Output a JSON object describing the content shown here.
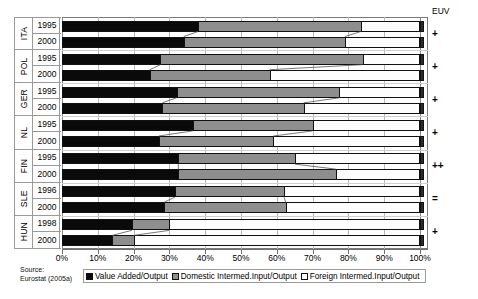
{
  "chart_data": {
    "type": "bar",
    "orientation": "horizontal",
    "stacked": true,
    "title": "",
    "xlabel": "",
    "ylabel": "",
    "xlim": [
      0,
      100
    ],
    "xtick_labels": [
      "0%",
      "10%",
      "20%",
      "30%",
      "40%",
      "50%",
      "60%",
      "70%",
      "80%",
      "90%",
      "100%"
    ],
    "xticks": [
      0,
      10,
      20,
      30,
      40,
      50,
      60,
      70,
      80,
      90,
      100
    ],
    "grid": true,
    "legend_position": "bottom",
    "series": [
      {
        "name": "Value Added/Output",
        "color": "#0a0a0a"
      },
      {
        "name": "Domestic Intermed.Input/Output",
        "color": "#8e8e8e"
      },
      {
        "name": "Foreign Intermed.Input/Output",
        "color": "#ffffff"
      }
    ],
    "groups": [
      {
        "country": "ITA",
        "euv": "+",
        "rows": [
          {
            "year": "1995",
            "value_added": 38.0,
            "domestic_input": 45.5,
            "foreign_input": 16.5
          },
          {
            "year": "2000",
            "value_added": 34.0,
            "domestic_input": 45.0,
            "foreign_input": 21.0
          }
        ]
      },
      {
        "country": "POL",
        "euv": "+",
        "rows": [
          {
            "year": "1995",
            "value_added": 27.5,
            "domestic_input": 56.5,
            "foreign_input": 16.0
          },
          {
            "year": "2000",
            "value_added": 24.5,
            "domestic_input": 33.5,
            "foreign_input": 42.0
          }
        ]
      },
      {
        "country": "GER",
        "euv": "+",
        "rows": [
          {
            "year": "1995",
            "value_added": 32.0,
            "domestic_input": 45.5,
            "foreign_input": 22.5
          },
          {
            "year": "2000",
            "value_added": 28.0,
            "domestic_input": 39.5,
            "foreign_input": 32.5
          }
        ]
      },
      {
        "country": "NL",
        "euv": "+",
        "rows": [
          {
            "year": "1995",
            "value_added": 36.5,
            "domestic_input": 33.5,
            "foreign_input": 30.0
          },
          {
            "year": "2000",
            "value_added": 27.0,
            "domestic_input": 32.0,
            "foreign_input": 41.0
          }
        ]
      },
      {
        "country": "FIN",
        "euv": "++",
        "rows": [
          {
            "year": "1995",
            "value_added": 32.5,
            "domestic_input": 32.5,
            "foreign_input": 35.0
          },
          {
            "year": "2000",
            "value_added": 32.5,
            "domestic_input": 44.0,
            "foreign_input": 23.5
          }
        ]
      },
      {
        "country": "SLE",
        "euv": "=",
        "rows": [
          {
            "year": "1996",
            "value_added": 31.5,
            "domestic_input": 30.5,
            "foreign_input": 38.0
          },
          {
            "year": "2000",
            "value_added": 28.5,
            "domestic_input": 34.0,
            "foreign_input": 37.5
          }
        ]
      },
      {
        "country": "HUN",
        "euv": "+",
        "rows": [
          {
            "year": "1998",
            "value_added": 19.5,
            "domestic_input": 10.5,
            "foreign_input": 70.0
          },
          {
            "year": "2000",
            "value_added": 14.0,
            "domestic_input": 6.0,
            "foreign_input": 80.0
          }
        ]
      }
    ]
  },
  "euv": {
    "title": "EUV"
  },
  "source": {
    "line1": "Source:",
    "line2": "Eurostat (2005a)"
  },
  "legend": {
    "items": [
      {
        "label": "Value Added/Output",
        "swatch": "va"
      },
      {
        "label": "Domestic Intermed.Input/Output",
        "swatch": "dom"
      },
      {
        "label": "Foreign Intermed.Input/Output",
        "swatch": "for"
      }
    ]
  }
}
